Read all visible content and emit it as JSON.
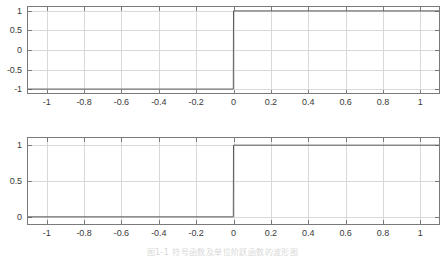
{
  "figure": {
    "caption": "图1-1  符号函数及单位阶跃函数的波形图",
    "background_color": "#ffffff",
    "axis_color": "#7a7a7a",
    "grid_color": "#d9d9d9",
    "line_color": "#5a5a5a"
  },
  "chart_data": [
    {
      "type": "line",
      "name": "signum-function",
      "title": "",
      "xlabel": "",
      "ylabel": "",
      "xlim": [
        -1.1,
        1.1
      ],
      "ylim": [
        -1.1,
        1.1
      ],
      "grid": true,
      "legend": "none",
      "xticks": [
        -1,
        -0.8,
        -0.6,
        -0.4,
        -0.2,
        0,
        0.2,
        0.4,
        0.6,
        0.8,
        1
      ],
      "xticklabels": [
        "-1",
        "-0.8",
        "-0.6",
        "-0.4",
        "-0.2",
        "0",
        "0.2",
        "0.4",
        "0.6",
        "0.8",
        "1"
      ],
      "yticks": [
        -1,
        -0.5,
        0,
        0.5,
        1
      ],
      "yticklabels": [
        "-1",
        "-0.5",
        "0",
        "0.5",
        "1"
      ],
      "x": [
        -1.1,
        -0.001,
        0,
        1.1
      ],
      "y": [
        -1,
        -1,
        1,
        1
      ]
    },
    {
      "type": "line",
      "name": "unit-step-function",
      "title": "",
      "xlabel": "",
      "ylabel": "",
      "xlim": [
        -1.1,
        1.1
      ],
      "ylim": [
        -0.1,
        1.1
      ],
      "grid": true,
      "legend": "none",
      "xticks": [
        -1,
        -0.8,
        -0.6,
        -0.4,
        -0.2,
        0,
        0.2,
        0.4,
        0.6,
        0.8,
        1
      ],
      "xticklabels": [
        "-1",
        "-0.8",
        "-0.6",
        "-0.4",
        "-0.2",
        "0",
        "0.2",
        "0.4",
        "0.6",
        "0.8",
        "1"
      ],
      "yticks": [
        0,
        0.5,
        1
      ],
      "yticklabels": [
        "0",
        "0.5",
        "1"
      ],
      "x": [
        -1.1,
        -0.001,
        0,
        1.1
      ],
      "y": [
        0,
        0,
        1,
        1
      ]
    }
  ]
}
